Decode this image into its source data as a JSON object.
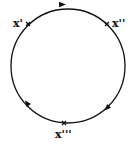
{
  "diagram": {
    "type": "closed-orbit-circle",
    "stroke_color": "#111111",
    "direction": "clockwise",
    "points": [
      {
        "id": "p1",
        "label": "x'",
        "marker": "cross"
      },
      {
        "id": "p2",
        "label": "x''",
        "marker": "cross"
      },
      {
        "id": "p3",
        "label": "x'''",
        "marker": "cross"
      }
    ],
    "arrows": [
      {
        "position": "top",
        "direction": "right"
      },
      {
        "position": "lower-right",
        "direction": "down-left"
      },
      {
        "position": "lower-left",
        "direction": "up-left"
      }
    ]
  }
}
